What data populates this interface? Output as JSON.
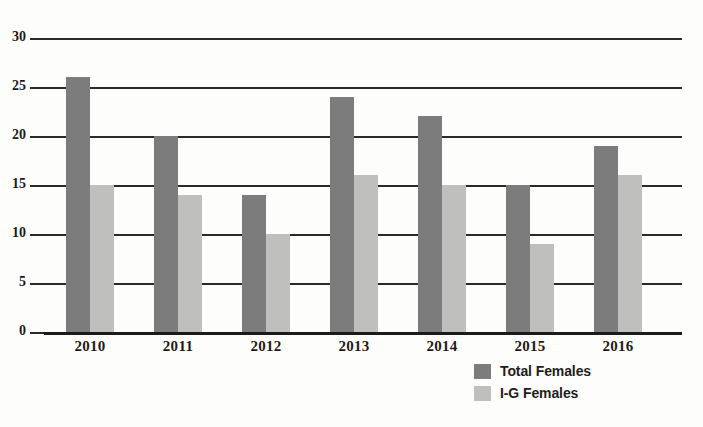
{
  "chart_data": {
    "type": "bar",
    "title": "",
    "subtitle": "",
    "xlabel": "",
    "ylabel": "",
    "categories": [
      "2010",
      "2011",
      "2012",
      "2013",
      "2014",
      "2015",
      "2016"
    ],
    "series": [
      {
        "name": "Total Females",
        "color": "#7c7c7c",
        "values": [
          26,
          20,
          14,
          24,
          22,
          15,
          19
        ]
      },
      {
        "name": "I-G Females",
        "color": "#bfbfbd",
        "values": [
          15,
          14,
          10,
          16,
          15,
          9,
          16
        ]
      }
    ],
    "ylim": [
      0,
      30
    ],
    "y_ticks": [
      0,
      5,
      10,
      15,
      20,
      25,
      30
    ],
    "y_tick_labels": [
      "0",
      "5",
      "10",
      "15",
      "20",
      "25",
      "30"
    ],
    "grid": true,
    "grid_axis": "y",
    "legend_position": "bottom-right",
    "bar_mode": "grouped",
    "background_color": "#fdfdfc",
    "gridline_color": "#2a2a2a",
    "text_color": "#1b1b1b"
  },
  "legend": {
    "items": [
      {
        "label": "Total Females",
        "color": "#7c7c7c"
      },
      {
        "label": "I-G Females",
        "color": "#bfbfbd"
      }
    ]
  }
}
